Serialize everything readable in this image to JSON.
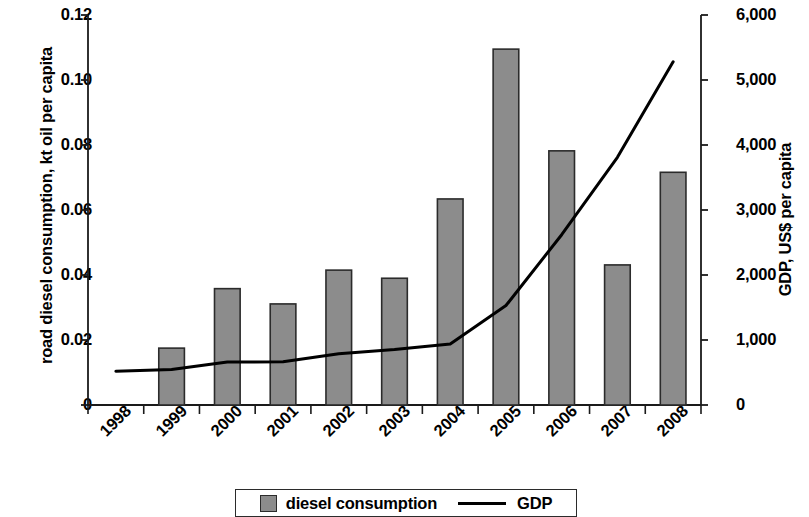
{
  "chart_data": {
    "type": "bar",
    "title": "",
    "xlabel": "",
    "ylabel": "road diesel consumption, kt oil per capita",
    "y2label": "GDP, US$ per capita",
    "categories": [
      "1998",
      "1999",
      "2000",
      "2001",
      "2002",
      "2003",
      "2004",
      "2005",
      "2006",
      "2007",
      "2008"
    ],
    "ylim": [
      0,
      0.12
    ],
    "y2lim": [
      0,
      6000
    ],
    "yticks": [
      0,
      0.02,
      0.04,
      0.06,
      0.08,
      0.1,
      0.12
    ],
    "ytick_labels": [
      "0",
      "0.02",
      "0.04",
      "0.06",
      "0.08",
      "0.10",
      "0.12"
    ],
    "y2ticks": [
      0,
      1000,
      2000,
      3000,
      4000,
      5000,
      6000
    ],
    "y2tick_labels": [
      "0",
      "1,000",
      "2,000",
      "3,000",
      "4,000",
      "5,000",
      "6,000"
    ],
    "grid": false,
    "legend_position": "bottom",
    "series": [
      {
        "name": "diesel consumption",
        "type": "bar",
        "axis": "left",
        "color": "#8c8c8c",
        "edge_color": "#2b2b2b",
        "values": [
          null,
          0.0175,
          0.0358,
          0.0311,
          0.0415,
          0.039,
          0.0634,
          0.1095,
          0.0782,
          0.0431,
          0.0716
        ]
      },
      {
        "name": "GDP",
        "type": "line",
        "axis": "right",
        "color": "#000000",
        "values": [
          520,
          545,
          660,
          665,
          790,
          855,
          940,
          1530,
          2620,
          3810,
          5280
        ]
      }
    ]
  },
  "axes": {
    "left_title": "road diesel consumption, kt oil per capita",
    "right_title": "GDP, US$ per capita"
  },
  "legend": {
    "bar_label": "diesel consumption",
    "line_label": "GDP"
  }
}
